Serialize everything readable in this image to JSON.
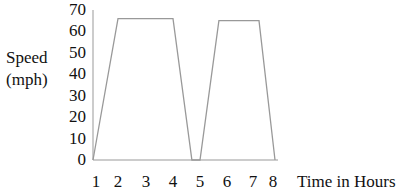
{
  "chart_data": {
    "type": "line",
    "title": "",
    "xlabel": "Time in Hours",
    "ylabel": "Speed (mph)",
    "ylabel_lines": [
      "Speed",
      "(mph)"
    ],
    "x_ticks": [
      "1",
      "2",
      "3",
      "4",
      "5",
      "6",
      "7",
      "8"
    ],
    "y_ticks": [
      "0",
      "10",
      "20",
      "30",
      "40",
      "50",
      "60",
      "70"
    ],
    "ylim": [
      0,
      70
    ],
    "xlim": [
      1,
      8
    ],
    "grid": false,
    "legend": null,
    "series": [
      {
        "name": "Speed",
        "x": [
          1,
          2,
          4,
          4.7,
          5,
          5.7,
          7.3,
          8
        ],
        "y": [
          0,
          66,
          66,
          0,
          0,
          65,
          65,
          0
        ]
      }
    ]
  }
}
